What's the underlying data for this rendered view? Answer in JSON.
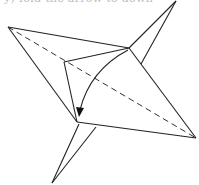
{
  "figure": {
    "caption_partial": "y) fold the arrow to down",
    "colors": {
      "line": "#222222",
      "dashed": "#333333",
      "background": "#ffffff"
    },
    "elements": {
      "outline": "outline of paper crane base",
      "valley_fold": "dashed diagonal fold line",
      "fold_arrow": "curved arrow pointing down",
      "top_flap": "top-right pointed flap",
      "bottom_flap": "bottom-left pointed flap"
    }
  }
}
